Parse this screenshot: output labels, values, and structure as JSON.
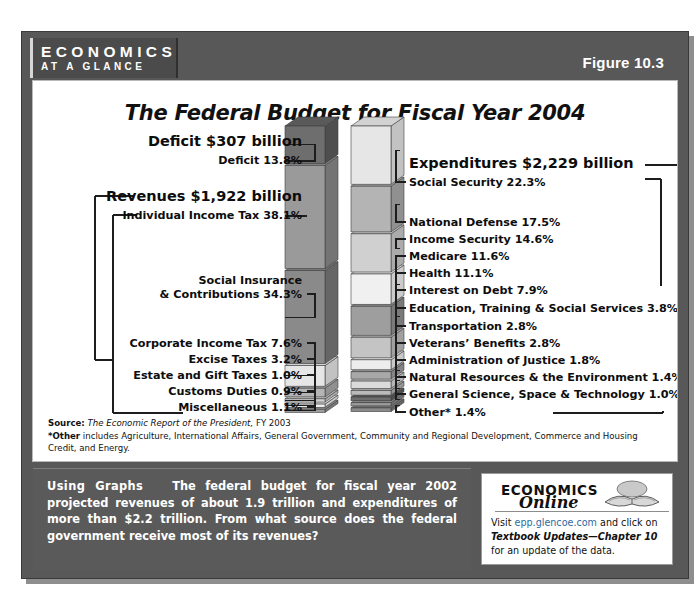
{
  "banner": {
    "brand_top": "ECONOMICS",
    "brand_bottom": "AT A GLANCE",
    "figure_label": "Figure 10.3"
  },
  "chart_title": "The Federal Budget for Fiscal Year 2004",
  "headings": {
    "deficit": "Deficit  $307 billion",
    "revenues": "Revenues  $1,922 billion",
    "expenditures": "Expenditures  $2,229 billion"
  },
  "notes": {
    "source_label": "Source:",
    "source_italic": "The Economic Report of the President,",
    "source_rest": " FY 2003",
    "other_label": "*Other",
    "other_text": " includes Agriculture, International Affairs, General Government, Community and Regional Development, Commerce and Housing Credit, and Energy."
  },
  "caption": {
    "lead": "Using Graphs",
    "body": "The federal budget for fiscal year 2002 projected revenues of about 1.9 trillion and expenditures of more than $2.2 trillion. From what source does the federal government receive most of its revenues?"
  },
  "economics_online": {
    "title_top": "ECONOMICS",
    "title_bottom": "Online",
    "visit_prefix": "Visit ",
    "link": "epp.glencoe.com",
    "visit_mid": " and click on ",
    "italic_part": "Textbook Updates—Chapter 10",
    "visit_suffix": " for an update of the data."
  },
  "chart_data": {
    "type": "bar",
    "subtype": "stacked-3d-column",
    "title": "The Federal Budget for Fiscal Year 2004",
    "unit": "percent of total",
    "series": [
      {
        "name": "Revenues",
        "total_label": "Revenues  $1,922 billion",
        "total_value": 1922,
        "total_unit": "billion USD",
        "deficit_label": "Deficit  $307 billion",
        "deficit_value": 307,
        "categories": [
          "Deficit",
          "Individual Income Tax",
          "Social Insurance & Contributions",
          "Corporate Income Tax",
          "Excise Taxes",
          "Estate and Gift Taxes",
          "Customs Duties",
          "Miscellaneous"
        ],
        "values": [
          13.8,
          38.1,
          34.3,
          7.6,
          3.2,
          1.0,
          0.9,
          1.1
        ],
        "labels": [
          "Deficit  13.8%",
          "Individual Income Tax  38.1%",
          "Social Insurance\n& Contributions  34.3%",
          "Corporate Income Tax  7.6%",
          "Excise Taxes  3.2%",
          "Estate and Gift Taxes  1.0%",
          "Customs Duties  0.9%",
          "Miscellaneous  1.1%"
        ]
      },
      {
        "name": "Expenditures",
        "total_label": "Expenditures  $2,229 billion",
        "total_value": 2229,
        "total_unit": "billion USD",
        "categories": [
          "Social Security",
          "National Defense",
          "Income Security",
          "Medicare",
          "Health",
          "Interest on Debt",
          "Education, Training & Social Services",
          "Transportation",
          "Veterans' Benefits",
          "Administration of Justice",
          "Natural Resources & the Environment",
          "General Science, Space & Technology",
          "Other*"
        ],
        "values": [
          22.3,
          17.5,
          14.6,
          11.6,
          11.1,
          7.9,
          3.8,
          2.8,
          2.8,
          1.8,
          1.4,
          1.0,
          1.4
        ],
        "labels": [
          "Social Security  22.3%",
          "National Defense  17.5%",
          "Income Security  14.6%",
          "Medicare  11.6%",
          "Health  11.1%",
          "Interest on Debt  7.9%",
          "Education, Training & Social Services  3.8%",
          "Transportation  2.8%",
          "Veterans’ Benefits  2.8%",
          "Administration of Justice  1.8%",
          "Natural Resources & the Environment  1.4%",
          "General Science, Space & Technology  1.0%",
          "Other*  1.4%"
        ]
      }
    ],
    "legend": "none",
    "grid": false
  },
  "left_labels": {
    "deficit_pct": "Deficit  13.8%",
    "iit": "Individual Income Tax  38.1%",
    "si_line1": "Social Insurance",
    "si_line2": "& Contributions  34.3%",
    "cit": "Corporate Income Tax  7.6%",
    "excise": "Excise Taxes  3.2%",
    "estate": "Estate and Gift Taxes  1.0%",
    "customs": "Customs Duties  0.9%",
    "misc": "Miscellaneous  1.1%"
  },
  "right_labels": {
    "ss": "Social Security  22.3%",
    "nd": "National Defense  17.5%",
    "is": "Income Security  14.6%",
    "medicare": "Medicare  11.6%",
    "health": "Health  11.1%",
    "interest": "Interest on Debt  7.9%",
    "edu": "Education, Training & Social Services  3.8%",
    "trans": "Transportation  2.8%",
    "vets": "Veterans’ Benefits  2.8%",
    "justice": "Administration of Justice  1.8%",
    "nat": "Natural Resources & the Environment  1.4%",
    "sci": "General Science, Space & Technology  1.0%",
    "other": "Other*  1.4%"
  }
}
